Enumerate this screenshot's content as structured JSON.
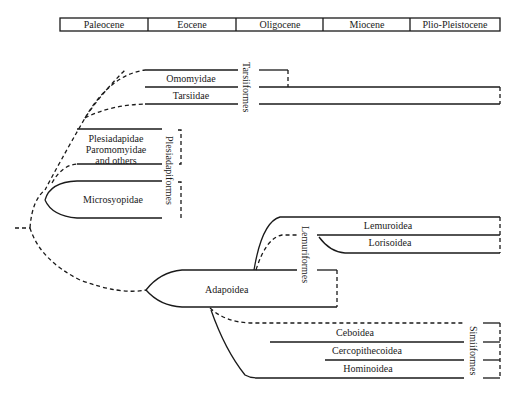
{
  "header": {
    "epochs": [
      "Paleocene",
      "Eocene",
      "Oligocene",
      "Miocene",
      "Plio-Pleistocene"
    ]
  },
  "groups": {
    "tarsiiformes": "Tarsiiformes",
    "plesiadapiformes": "Plesiadapiformes",
    "lemuriformes": "Lemuriformes",
    "simiiformes": "Simiiformes"
  },
  "taxa": {
    "omomyidae": "Omomyidae",
    "tarsiidae": "Tarsiidae",
    "plesiadapidae": "Plesiadapidae",
    "paromomyidae": "Paromomyidae",
    "and_others": "and others",
    "microsyopidae": "Microsyopidae",
    "lemuroidea": "Lemuroidea",
    "lorisoidea": "Lorisoidea",
    "adapoidea": "Adapoidea",
    "ceboidea": "Ceboidea",
    "cercopithecoidea": "Cercopithecoidea",
    "hominoidea": "Hominoidea"
  },
  "colors": {
    "line": "#1a1a1a",
    "background": "#ffffff"
  }
}
